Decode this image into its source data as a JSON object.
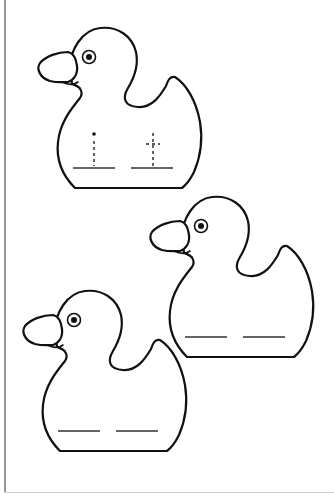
{
  "worksheet": {
    "type": "duck tracing worksheet",
    "colors": {
      "outline": "#111111",
      "border": "#9a9a9a",
      "background": "#ffffff"
    },
    "ducks": [
      {
        "id": "duck-1",
        "offset": [
          0,
          0
        ],
        "letter_guides": [
          "i",
          "t"
        ],
        "writing_lines": 2
      },
      {
        "id": "duck-2",
        "offset": [
          112,
          169
        ],
        "letter_guides": [],
        "writing_lines": 2
      },
      {
        "id": "duck-3",
        "offset": [
          -15,
          263
        ],
        "letter_guides": [],
        "writing_lines": 2
      }
    ]
  }
}
